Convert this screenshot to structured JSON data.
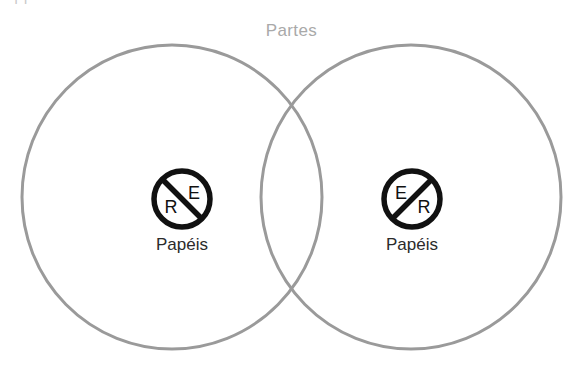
{
  "canvas": {
    "width": 583,
    "height": 366,
    "background": "#ffffff"
  },
  "diagram": {
    "type": "venn-two-set",
    "title": "Partes",
    "title_color": "#a9a9a9",
    "circle_stroke": "#9a9a9a",
    "circle_stroke_width": 3,
    "clipped_top_text": "|    |",
    "sets": [
      {
        "id": "left",
        "label": "Papéis",
        "label_color": "#2b2b2b",
        "icon_name": "no-entry-er-icon",
        "icon_letters": {
          "top": "E",
          "bottom": "R"
        },
        "icon_top_letter_side": "right",
        "icon_bottom_letter_side": "left",
        "icon_slash_direction": "top-left-to-bottom-right",
        "icon_color": "#111111",
        "cx": 172,
        "cy": 197,
        "rx": 150,
        "ry": 152
      },
      {
        "id": "right",
        "label": "Papéis",
        "label_color": "#2b2b2b",
        "icon_name": "no-entry-er-icon",
        "icon_letters": {
          "top": "E",
          "bottom": "R"
        },
        "icon_top_letter_side": "left",
        "icon_bottom_letter_side": "right",
        "icon_slash_direction": "bottom-left-to-top-right",
        "icon_color": "#111111",
        "cx": 411,
        "cy": 197,
        "rx": 150,
        "ry": 152
      }
    ],
    "intersections": [
      {
        "x": 292,
        "y": 100
      },
      {
        "x": 292,
        "y": 295
      }
    ]
  }
}
